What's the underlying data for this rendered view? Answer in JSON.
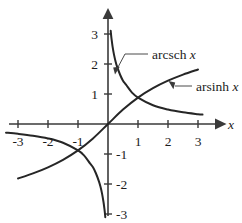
{
  "chart_data": {
    "type": "line",
    "title": "",
    "xlabel": "x",
    "ylabel": "",
    "xlim": [
      -3.45,
      3.6
    ],
    "ylim": [
      -3.35,
      3.45
    ],
    "grid": false,
    "legend_position": "inline-annotations",
    "x_ticks": [
      -3,
      -2,
      -1,
      1,
      2,
      3
    ],
    "x_tick_labels": [
      "-3",
      "-2",
      "-1",
      "1",
      "2",
      "3"
    ],
    "y_ticks": [
      -3,
      -2,
      -1,
      1,
      2,
      3
    ],
    "y_tick_labels": [
      "-3",
      "-2",
      "-1",
      "1",
      "2",
      "3"
    ],
    "series": [
      {
        "name": "arcsch x",
        "label": "arcsch",
        "label_variable": "x",
        "formula": "arcsch(x) = ln(1/x + sqrt(1/x^2 + 1))",
        "color": "#262626",
        "branches": [
          {
            "name": "negative-branch",
            "x": [
              -3.4,
              -3.0,
              -2.5,
              -2.0,
              -1.5,
              -1.0,
              -0.8,
              -0.6,
              -0.5,
              -0.4,
              -0.3,
              -0.25,
              -0.2,
              -0.15,
              -0.12,
              -0.1,
              -0.09
            ],
            "y": [
              -0.288,
              -0.327,
              -0.39,
              -0.481,
              -0.625,
              -0.881,
              -1.048,
              -1.313,
              -1.444,
              -1.65,
              -1.919,
              -2.094,
              -2.312,
              -2.599,
              -2.821,
              -2.998,
              -3.106
            ]
          },
          {
            "name": "positive-branch",
            "x": [
              0.09,
              0.1,
              0.12,
              0.15,
              0.2,
              0.25,
              0.3,
              0.4,
              0.5,
              0.6,
              0.8,
              1.0,
              1.5,
              2.0,
              2.5,
              3.0,
              3.15
            ],
            "y": [
              3.106,
              2.998,
              2.821,
              2.599,
              2.312,
              2.094,
              1.919,
              1.65,
              1.444,
              1.313,
              1.048,
              0.881,
              0.625,
              0.481,
              0.39,
              0.327,
              0.313
            ]
          }
        ]
      },
      {
        "name": "arsinh x",
        "label": "arsinh",
        "label_variable": "x",
        "formula": "arsinh(x) = ln(x + sqrt(x^2 + 1))",
        "color": "#262626",
        "branches": [
          {
            "name": "main-branch",
            "x": [
              -3.0,
              -2.5,
              -2.0,
              -1.5,
              -1.0,
              -0.5,
              0.0,
              0.5,
              1.0,
              1.5,
              2.0,
              2.5,
              3.0
            ],
            "y": [
              -1.818,
              -1.647,
              -1.444,
              -1.195,
              -0.881,
              -0.481,
              0.0,
              0.481,
              0.881,
              1.195,
              1.444,
              1.647,
              1.818
            ]
          }
        ]
      }
    ],
    "annotations": [
      {
        "name": "arcsch-annotation",
        "text": "arcsch",
        "variable": "x",
        "text_x": 1.05,
        "text_y": 2.42,
        "points_to_x": 0.22,
        "points_to_y": 1.85
      },
      {
        "name": "arsinh-annotation",
        "text": "arsinh",
        "variable": "x",
        "text_x": 2.42,
        "text_y": 1.32,
        "points_to_x": 1.92,
        "points_to_y": 1.52
      }
    ]
  },
  "axes": {
    "x_axis_label": "x",
    "x_tick_labels": [
      "-3",
      "-2",
      "-1",
      "1",
      "2",
      "3"
    ],
    "y_tick_labels": [
      "3",
      "2",
      "1",
      "-1",
      "-2",
      "-3"
    ]
  },
  "labels": {
    "arcsch": "arcsch",
    "arcsch_var": "x",
    "arsinh": "arsinh",
    "arsinh_var": "x"
  },
  "colors": {
    "background": "#ffffff",
    "axis": "#3a3a3a",
    "curve": "#262626",
    "text": "#1c1c1c",
    "leader": "#4a4a4a"
  }
}
